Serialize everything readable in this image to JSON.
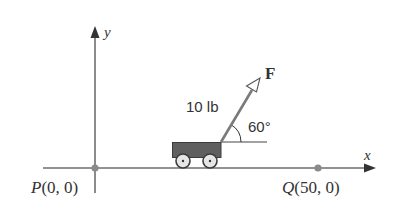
{
  "diagram": {
    "axes": {
      "x_label": "x",
      "y_label": "y"
    },
    "points": [
      {
        "name": "P",
        "label": "P",
        "coords": "(0, 0)"
      },
      {
        "name": "Q",
        "label": "Q",
        "coords": "(50, 0)"
      }
    ],
    "force": {
      "label": "F",
      "magnitude": "10 lb",
      "angle": "60°"
    },
    "colors": {
      "axis": "#6e6e6e",
      "point": "#8a8a8a",
      "cart_body": "#5f5f5f",
      "handle": "#7a7a7a",
      "text": "#333333"
    }
  }
}
